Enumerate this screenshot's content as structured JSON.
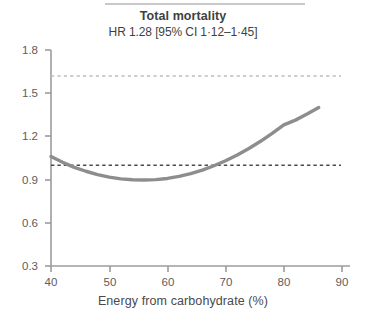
{
  "figure": {
    "title": "Total mortality",
    "subtitle": "HR 1.28 [95% CI 1·12–1·45]",
    "has_top_rule": true
  },
  "chart_data": {
    "type": "line",
    "title": "Total mortality",
    "subtitle": "HR 1.28 [95% CI 1·12–1·45]",
    "xlabel": "Energy from carbohydrate (%)",
    "ylabel": "",
    "xlim": [
      40,
      90
    ],
    "ylim": [
      0.3,
      1.8
    ],
    "xticks": [
      40,
      50,
      60,
      70,
      80,
      90
    ],
    "yticks": [
      0.3,
      0.6,
      0.9,
      1.2,
      1.5,
      1.8
    ],
    "xtick_labels": [
      "40",
      "50",
      "60",
      "70",
      "80",
      "90"
    ],
    "ytick_labels": [
      "0.3",
      "0.6",
      "0.9",
      "1.2",
      "1.5",
      "1.8"
    ],
    "grid": false,
    "legend": false,
    "legend_position": "none",
    "series": [
      {
        "name": "Hazard ratio spline",
        "style": "solid",
        "color": "#8d8d8f",
        "width": 3.4,
        "x": [
          40,
          42,
          44,
          46,
          48,
          50,
          52,
          54,
          56,
          58,
          60,
          62,
          64,
          66,
          68,
          70,
          72,
          74,
          76,
          78,
          80,
          82,
          84,
          86
        ],
        "y": [
          1.06,
          1.02,
          0.985,
          0.958,
          0.935,
          0.917,
          0.905,
          0.899,
          0.897,
          0.9,
          0.908,
          0.922,
          0.941,
          0.966,
          0.996,
          1.031,
          1.071,
          1.116,
          1.166,
          1.221,
          1.28,
          1.313,
          1.355,
          1.4
        ]
      }
    ],
    "reference_lines": [
      {
        "name": "upper-reference-line",
        "orientation": "horizontal",
        "value": 1.62,
        "style": "dashed",
        "color": "#bdbdbf",
        "x_start": 40,
        "x_end": 89.9
      },
      {
        "name": "null-reference-line",
        "orientation": "horizontal",
        "value": 1.0,
        "style": "dashed",
        "color": "#4b4b4d",
        "x_start": 40,
        "x_end": 89.9
      }
    ],
    "axis_color": "#9c9c9e"
  },
  "axes": {
    "y_ticks": [
      {
        "label": "1.8",
        "value": 1.8
      },
      {
        "label": "1.5",
        "value": 1.5
      },
      {
        "label": "1.2",
        "value": 1.2
      },
      {
        "label": "0.9",
        "value": 0.9
      },
      {
        "label": "0.6",
        "value": 0.6
      },
      {
        "label": "0.3",
        "value": 0.3
      }
    ],
    "x_ticks": [
      {
        "label": "40",
        "value": 40
      },
      {
        "label": "50",
        "value": 50
      },
      {
        "label": "60",
        "value": 60
      },
      {
        "label": "70",
        "value": 70
      },
      {
        "label": "80",
        "value": 80
      },
      {
        "label": "90",
        "value": 90
      }
    ],
    "x_title": "Energy from carbohydrate (%)"
  }
}
